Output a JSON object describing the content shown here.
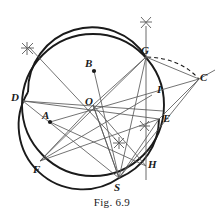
{
  "figure": {
    "caption": "Fig. 6.9",
    "width": 224,
    "height": 215,
    "background": "#ffffff",
    "stroke_dark": "#1a1a1a",
    "stroke_thin": "#5a5a5a",
    "labels": [
      {
        "id": "A",
        "text": "A",
        "x": 42,
        "y": 110
      },
      {
        "id": "B",
        "text": "B",
        "x": 85,
        "y": 58
      },
      {
        "id": "C",
        "text": "C",
        "x": 200,
        "y": 72
      },
      {
        "id": "D",
        "text": "D",
        "x": 11,
        "y": 92
      },
      {
        "id": "E",
        "text": "E",
        "x": 163,
        "y": 113
      },
      {
        "id": "F",
        "text": "F",
        "x": 33,
        "y": 164
      },
      {
        "id": "G",
        "text": "G",
        "x": 141,
        "y": 45
      },
      {
        "id": "H",
        "text": "H",
        "x": 148,
        "y": 159
      },
      {
        "id": "I",
        "text": "I",
        "x": 157,
        "y": 84
      },
      {
        "id": "O",
        "text": "O",
        "x": 85,
        "y": 96
      },
      {
        "id": "S",
        "text": "S",
        "x": 114,
        "y": 182
      }
    ],
    "points": {
      "A": {
        "x": 50,
        "y": 122
      },
      "B": {
        "x": 94,
        "y": 71
      },
      "C": {
        "x": 199,
        "y": 79
      },
      "D": {
        "x": 23,
        "y": 101
      },
      "E": {
        "x": 159,
        "y": 119
      },
      "F": {
        "x": 40,
        "y": 161
      },
      "G": {
        "x": 146,
        "y": 57
      },
      "H": {
        "x": 146,
        "y": 166
      },
      "I": {
        "x": 152,
        "y": 95
      },
      "O": {
        "x": 93,
        "y": 105
      },
      "S": {
        "x": 119,
        "y": 178
      }
    },
    "main_circle": {
      "cx": 93,
      "cy": 105,
      "r": 71
    },
    "construction_circle": {
      "cx": 146,
      "cy": 120,
      "r": 64
    },
    "dashed_arc": {
      "from": "G",
      "to": "C"
    },
    "vertical_line": {
      "x": 146,
      "y_top": 26,
      "y_bottom": 180
    },
    "arc_marks": [
      {
        "x": 27,
        "y": 48
      },
      {
        "x": 146,
        "y": 22
      },
      {
        "x": 119,
        "y": 143
      },
      {
        "x": 144,
        "y": 126
      }
    ],
    "dots": [
      "A",
      "B"
    ]
  }
}
